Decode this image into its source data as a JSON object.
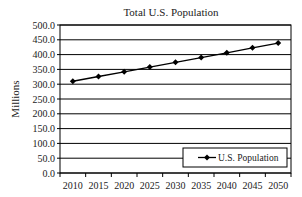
{
  "chart_data": {
    "type": "line",
    "title": "Total U.S. Population",
    "xlabel": "",
    "ylabel": "Millions",
    "categories": [
      "2010",
      "2015",
      "2020",
      "2025",
      "2030",
      "2035",
      "2040",
      "2045",
      "2050"
    ],
    "series": [
      {
        "name": "U.S. Population",
        "values": [
          310,
          326,
          342,
          358,
          374,
          390,
          406,
          423,
          439
        ],
        "marker": "diamond",
        "color": "#000000"
      }
    ],
    "yticks": [
      "0.0",
      "50.0",
      "100.0",
      "150.0",
      "200.0",
      "250.0",
      "300.0",
      "350.0",
      "400.0",
      "450.0",
      "500.0"
    ],
    "ylim": [
      0,
      500
    ],
    "grid": true,
    "legend_position": "lower right, inside plot"
  }
}
